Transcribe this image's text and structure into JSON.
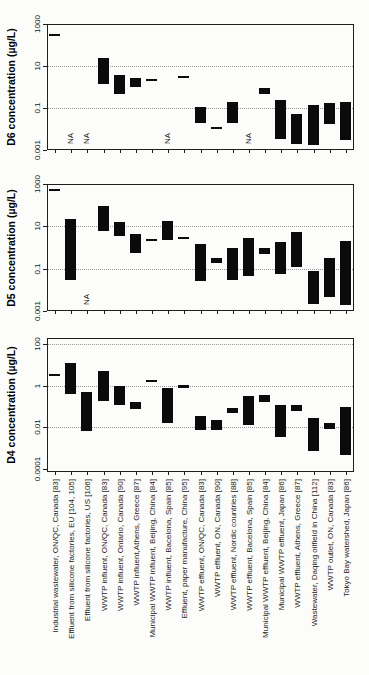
{
  "chart_data": {
    "type": "bar",
    "subtype": "floating-range-bars",
    "scale": "log",
    "grid": "dotted-horizontal",
    "legend_position": "none",
    "na_label": "NA",
    "colors": {
      "bar": "#0b0b0b",
      "grid": "#9a9a9a",
      "axis": "#1f1f1f",
      "text": "#161616"
    },
    "categories": [
      "Industrial wastewater, ON/QC, Canada [83]",
      "Effluent from silicone factories, EU [104, 105]",
      "Effluent from silicone factories, US [106]",
      "WWTP influent, ON/QC, Canada [83]",
      "WWTP influent, Ontario, Canada [90]",
      "WWTP influent,Athens, Greece [87]",
      "Municipal WWTP influent, Beijing, China [84]",
      "WWTP influent, Bacelona, Spain [85]",
      "Effluent, paper manufacture, China [95]",
      "WWTP effluent, ON/QC, Canada [83]",
      "WWTP effluent, ON, Canada [90]",
      "WWTP effluent, Nordic countries [88]",
      "WWTP effluent, Bacelona, Spain [85]",
      "Municipal WWTP effluent, Beijing, China [84]",
      "Municipal WWTP effluent, Japan [86]",
      "WWTP effluent, Athens, Greece [87]",
      "Wastewater, Daqing oilfield in China [112]",
      "WWTP outlet, ON, Canada [83]",
      "Tokyo Bay watershed, Japan [86]"
    ],
    "panels": [
      {
        "ylabel": "D6 concentration (µg/L)",
        "yticks": [
          "1000",
          "10",
          "0.1",
          "0.001"
        ],
        "ytick_values": [
          1000,
          10,
          0.1,
          0.001
        ],
        "ylim": [
          0.001,
          1000
        ],
        "gridline_values": [
          10,
          0.1
        ],
        "bars": [
          [
            350,
            350
          ],
          null,
          null,
          [
            1.5,
            25
          ],
          [
            0.45,
            3.7
          ],
          [
            0.95,
            2.6
          ],
          [
            2.3,
            2.3
          ],
          null,
          [
            3.5,
            3.5
          ],
          [
            0.02,
            0.11
          ],
          [
            0.013,
            0.013
          ],
          [
            0.02,
            0.2
          ],
          null,
          [
            0.45,
            0.85
          ],
          [
            0.0035,
            0.24
          ],
          [
            0.002,
            0.053
          ],
          [
            0.0017,
            0.14
          ],
          [
            0.017,
            0.17
          ],
          [
            0.003,
            0.2
          ]
        ]
      },
      {
        "ylabel": "D5 concentration (µg/L)",
        "yticks": [
          "1000",
          "10",
          "0.1",
          "0.001"
        ],
        "ytick_values": [
          1000,
          10,
          0.1,
          0.001
        ],
        "ylim": [
          0.001,
          1000
        ],
        "gridline_values": [
          10,
          0.1
        ],
        "bars": [
          [
            600,
            600
          ],
          [
            0.028,
            22
          ],
          null,
          [
            5.7,
            90
          ],
          [
            3.5,
            15.5
          ],
          [
            0.57,
            4.3
          ],
          [
            2.5,
            2.5
          ],
          [
            2.4,
            18.5
          ],
          [
            3.1,
            3.1
          ],
          [
            0.027,
            1.5
          ],
          [
            0.2,
            0.33
          ],
          [
            0.03,
            1.0
          ],
          [
            0.045,
            2.7
          ],
          [
            0.5,
            1.0
          ],
          [
            0.06,
            1.9
          ],
          [
            0.12,
            5.3
          ],
          [
            0.002,
            0.076
          ],
          [
            0.005,
            0.33
          ],
          [
            0.002,
            2.1
          ]
        ]
      },
      {
        "ylabel": "D4 concentration (µg/L)",
        "yticks": [
          "100",
          "1",
          "0.01",
          "0.0001"
        ],
        "ytick_values": [
          100,
          1,
          0.01,
          0.0001
        ],
        "ylim": [
          0.0001,
          100
        ],
        "gridline_values": [
          100,
          1,
          0.01
        ],
        "bars": [
          [
            3.5,
            3.5
          ],
          [
            0.4,
            12
          ],
          [
            0.007,
            0.52
          ],
          [
            0.18,
            4.9
          ],
          [
            0.12,
            0.95
          ],
          [
            0.076,
            0.16
          ],
          [
            1.9,
            1.9
          ],
          [
            0.016,
            0.78
          ],
          [
            0.8,
            1.1
          ],
          [
            0.008,
            0.036
          ],
          [
            0.0075,
            0.023
          ],
          [
            0.05,
            0.09
          ],
          [
            0.013,
            0.33
          ],
          [
            0.18,
            0.37
          ],
          [
            0.0033,
            0.12
          ],
          [
            0.06,
            0.12
          ],
          [
            0.0007,
            0.028
          ],
          [
            0.008,
            0.016
          ],
          [
            0.0005,
            0.1
          ]
        ]
      }
    ]
  }
}
